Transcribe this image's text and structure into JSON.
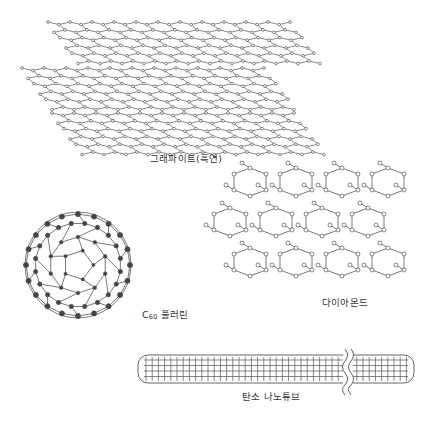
{
  "diagram": {
    "structures": [
      {
        "id": "graphite",
        "label": "그래파이트(흑연)",
        "layers": 3
      },
      {
        "id": "diamond",
        "label": "다이아몬드"
      },
      {
        "id": "fullerene",
        "label_prefix": "C",
        "label_sub": "60",
        "label_suffix": " 풀러린"
      },
      {
        "id": "nanotube",
        "label": "탄소 나노튜브"
      }
    ],
    "colors": {
      "line": "#555555",
      "atom_open": "#ffffff",
      "atom_filled": "#444444"
    }
  }
}
